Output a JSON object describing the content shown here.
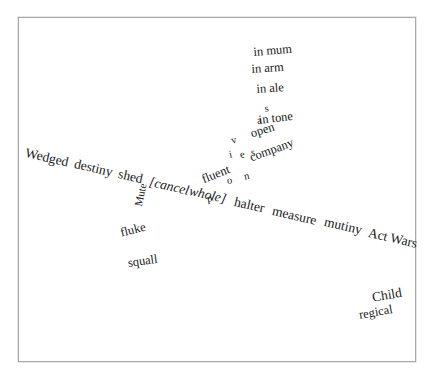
{
  "page": {
    "kind": "scanned-text-page",
    "background_color": "#ffffff",
    "border_color": "#a9a9a9",
    "text_color": "#191919"
  },
  "clusters": {
    "top_right": {
      "name": "stacked-phrases",
      "lines": [
        "in mum",
        "in arm",
        "in ale"
      ]
    },
    "middle_right": {
      "name": "tone-cluster",
      "lines": [
        "in tone",
        "open",
        "company"
      ]
    },
    "vertical_column": {
      "name": "vertical-letter-column",
      "letters": [
        "s",
        "a",
        "v",
        "i",
        "e",
        "s",
        "p",
        "o",
        "n"
      ]
    },
    "diagonal_line": {
      "name": "main-diagonal-sentence",
      "words": [
        "Wedged",
        "destiny",
        "shed",
        "[cancel",
        "whole]",
        "halter",
        "measure",
        "mutiny",
        "Act",
        "Wars"
      ],
      "bracketed_segment": "[cancel whole]"
    },
    "lower_left": {
      "name": "lower-left-words",
      "words": [
        "Mute",
        "fluke",
        "squall"
      ]
    },
    "fluent_word": {
      "name": "fluent-word",
      "text": "fluent"
    },
    "bottom_right": {
      "name": "bottom-right-words",
      "lines": [
        "Child",
        "regical"
      ]
    }
  }
}
